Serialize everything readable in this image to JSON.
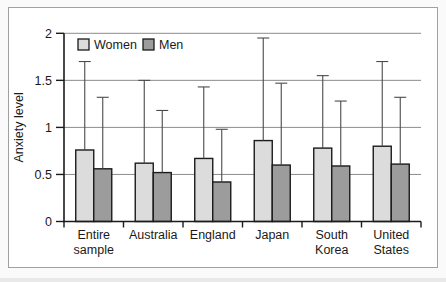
{
  "figure": {
    "ylabel": "Anxiety level",
    "legend": [
      "Women",
      "Men"
    ]
  },
  "chart_data": {
    "type": "bar",
    "title": "",
    "xlabel": "",
    "ylabel": "Anxiety level",
    "ylim": [
      0,
      2
    ],
    "yticks": [
      0,
      0.5,
      1,
      1.5,
      2
    ],
    "ytick_labels": [
      "0",
      "0.5",
      "1",
      "1.5",
      "2"
    ],
    "grid": true,
    "legend_position": "top-left-inside",
    "error_bars": "upper-only",
    "categories": [
      "Entire sample",
      "Australia",
      "England",
      "Japan",
      "South Korea",
      "United States"
    ],
    "series": [
      {
        "name": "Women",
        "color": "#dcdcdc",
        "values": [
          0.76,
          0.62,
          0.67,
          0.86,
          0.78,
          0.8
        ],
        "error_top": [
          1.7,
          1.5,
          1.43,
          1.95,
          1.55,
          1.7
        ]
      },
      {
        "name": "Men",
        "color": "#9c9c9c",
        "values": [
          0.56,
          0.52,
          0.42,
          0.6,
          0.59,
          0.61
        ],
        "error_top": [
          1.32,
          1.18,
          0.98,
          1.47,
          1.28,
          1.32
        ]
      }
    ],
    "colors": {
      "bar_stroke": "#1b1b1b",
      "grid_line": "#8c8c8c",
      "axis_line": "#1b1b1b",
      "error_bar": "#4a4a4a",
      "text": "#1a1a1a",
      "frame_border": "#a0a0a0"
    }
  }
}
